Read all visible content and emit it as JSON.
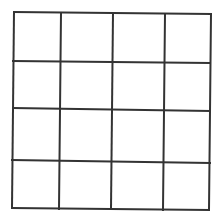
{
  "diagram": {
    "type": "grid",
    "rows": 4,
    "cols": 4,
    "background": "#ffffff",
    "line_color": "#333333",
    "line_width": 2,
    "horizontal_lines": [
      {
        "x1": 14,
        "y1": 12,
        "x2": 211,
        "y2": 14
      },
      {
        "x1": 13,
        "y1": 61,
        "x2": 210,
        "y2": 63
      },
      {
        "x1": 13,
        "y1": 108,
        "x2": 210,
        "y2": 111
      },
      {
        "x1": 12,
        "y1": 160,
        "x2": 210,
        "y2": 163
      },
      {
        "x1": 12,
        "y1": 208,
        "x2": 209,
        "y2": 210
      }
    ],
    "vertical_lines": [
      {
        "x1": 14,
        "y1": 12,
        "x2": 12,
        "y2": 208
      },
      {
        "x1": 61,
        "y1": 13,
        "x2": 59,
        "y2": 209
      },
      {
        "x1": 113,
        "y1": 13,
        "x2": 111,
        "y2": 209
      },
      {
        "x1": 165,
        "y1": 14,
        "x2": 163,
        "y2": 210
      },
      {
        "x1": 211,
        "y1": 14,
        "x2": 209,
        "y2": 210
      }
    ]
  }
}
